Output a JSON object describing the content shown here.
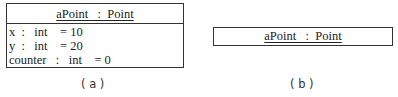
{
  "figure_a": {
    "object_name": "aPoint",
    "class_name": "Point",
    "title": "aPoint   :  Point",
    "attributes": [
      {
        "name": "x",
        "type": "int",
        "value": "10",
        "text": "x  :   int    = 10"
      },
      {
        "name": "y",
        "type": "int",
        "value": "20",
        "text": "y  :   int    = 20"
      },
      {
        "name": "counter",
        "type": "int",
        "value": "0",
        "text": "counter   :   int    = 0"
      }
    ],
    "caption": "( a )"
  },
  "figure_b": {
    "object_name": "aPoint",
    "class_name": "Point",
    "title": "aPoint   :  Point",
    "caption": "( b )"
  }
}
